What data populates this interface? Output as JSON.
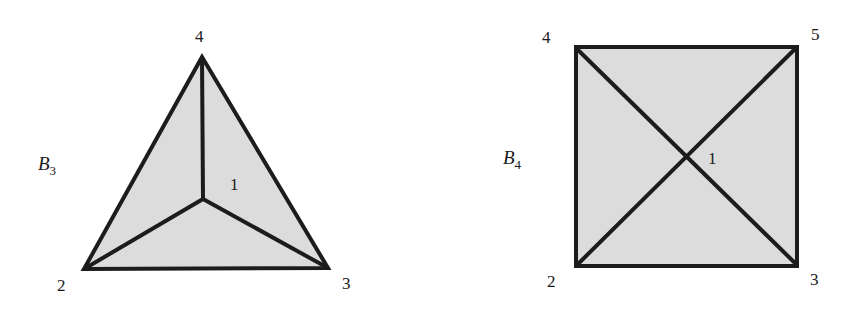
{
  "colors": {
    "fill": "#dcdcdc",
    "stroke": "#1c1c1c",
    "background": "#ffffff"
  },
  "figures": [
    {
      "id": "B3",
      "name": "B",
      "subscript": "3",
      "shape": "triangle",
      "vertices": [
        {
          "label": "4",
          "position": "top"
        },
        {
          "label": "2",
          "position": "bottom-left"
        },
        {
          "label": "3",
          "position": "bottom-right"
        },
        {
          "label": "1",
          "position": "center"
        }
      ],
      "edges": [
        [
          "4",
          "2"
        ],
        [
          "2",
          "3"
        ],
        [
          "3",
          "4"
        ],
        [
          "1",
          "4"
        ],
        [
          "1",
          "2"
        ],
        [
          "1",
          "3"
        ]
      ]
    },
    {
      "id": "B4",
      "name": "B",
      "subscript": "4",
      "shape": "square",
      "vertices": [
        {
          "label": "4",
          "position": "top-left"
        },
        {
          "label": "5",
          "position": "top-right"
        },
        {
          "label": "2",
          "position": "bottom-left"
        },
        {
          "label": "3",
          "position": "bottom-right"
        },
        {
          "label": "1",
          "position": "center"
        }
      ],
      "edges": [
        [
          "4",
          "5"
        ],
        [
          "5",
          "3"
        ],
        [
          "3",
          "2"
        ],
        [
          "2",
          "4"
        ],
        [
          "4",
          "3"
        ],
        [
          "5",
          "2"
        ]
      ]
    }
  ]
}
